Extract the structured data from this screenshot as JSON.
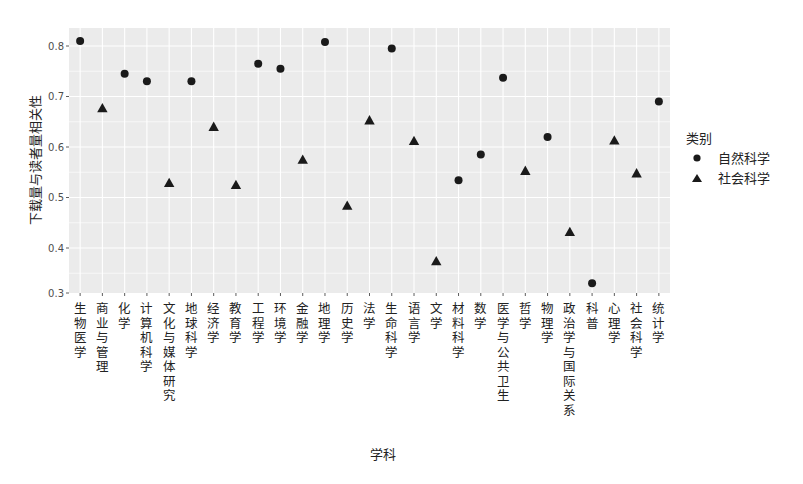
{
  "chart_data": {
    "type": "scatter",
    "title": "",
    "xlabel": "学科",
    "ylabel": "下载量与读者量相关性",
    "ylim": [
      0.31,
      0.835
    ],
    "yticks": [
      0.3,
      0.4,
      0.5,
      0.6,
      0.7,
      0.8
    ],
    "ytick_labels": [
      "0.3",
      "0.4",
      "0.5",
      "0.6",
      "0.7",
      "0.8"
    ],
    "grid": true,
    "legend": {
      "title": "类别",
      "position": "right",
      "entries": [
        {
          "label": "自然科学",
          "shape": "circle"
        },
        {
          "label": "社会科学",
          "shape": "triangle"
        }
      ]
    },
    "categories": [
      "生物医学",
      "商业与管理",
      "化学",
      "计算机科学",
      "文化与媒体研究",
      "地球科学",
      "经济学",
      "教育学",
      "工程学",
      "环境学",
      "金融学",
      "地理学",
      "历史学",
      "法学",
      "生命科学",
      "语言学",
      "文学",
      "材料科学",
      "数学",
      "医学与公共卫生",
      "哲学",
      "物理学",
      "政治学与国际关系",
      "科普",
      "心理学",
      "社会科学",
      "统计学"
    ],
    "points": [
      {
        "x": "生物医学",
        "y": 0.81,
        "group": "自然科学"
      },
      {
        "x": "商业与管理",
        "y": 0.677,
        "group": "社会科学"
      },
      {
        "x": "化学",
        "y": 0.745,
        "group": "自然科学"
      },
      {
        "x": "计算机科学",
        "y": 0.73,
        "group": "自然科学"
      },
      {
        "x": "文化与媒体研究",
        "y": 0.529,
        "group": "社会科学"
      },
      {
        "x": "地球科学",
        "y": 0.73,
        "group": "自然科学"
      },
      {
        "x": "经济学",
        "y": 0.64,
        "group": "社会科学"
      },
      {
        "x": "教育学",
        "y": 0.525,
        "group": "社会科学"
      },
      {
        "x": "工程学",
        "y": 0.765,
        "group": "自然科学"
      },
      {
        "x": "环境学",
        "y": 0.755,
        "group": "自然科学"
      },
      {
        "x": "金融学",
        "y": 0.575,
        "group": "社会科学"
      },
      {
        "x": "地理学",
        "y": 0.808,
        "group": "自然科学"
      },
      {
        "x": "历史学",
        "y": 0.484,
        "group": "社会科学"
      },
      {
        "x": "法学",
        "y": 0.653,
        "group": "社会科学"
      },
      {
        "x": "生命科学",
        "y": 0.795,
        "group": "自然科学"
      },
      {
        "x": "语言学",
        "y": 0.612,
        "group": "社会科学"
      },
      {
        "x": "文学",
        "y": 0.374,
        "group": "社会科学"
      },
      {
        "x": "材料科学",
        "y": 0.534,
        "group": "自然科学"
      },
      {
        "x": "数学",
        "y": 0.585,
        "group": "自然科学"
      },
      {
        "x": "医学与公共卫生",
        "y": 0.737,
        "group": "自然科学"
      },
      {
        "x": "哲学",
        "y": 0.553,
        "group": "社会科学"
      },
      {
        "x": "物理学",
        "y": 0.62,
        "group": "自然科学"
      },
      {
        "x": "政治学与国际关系",
        "y": 0.432,
        "group": "社会科学"
      },
      {
        "x": "科普",
        "y": 0.33,
        "group": "自然科学"
      },
      {
        "x": "心理学",
        "y": 0.613,
        "group": "社会科学"
      },
      {
        "x": "社会科学",
        "y": 0.548,
        "group": "社会科学"
      },
      {
        "x": "统计学",
        "y": 0.69,
        "group": "自然科学"
      }
    ]
  },
  "colors": {
    "panel_bg": "#ebebeb",
    "grid": "#ffffff",
    "point": "#1a1a1a"
  }
}
